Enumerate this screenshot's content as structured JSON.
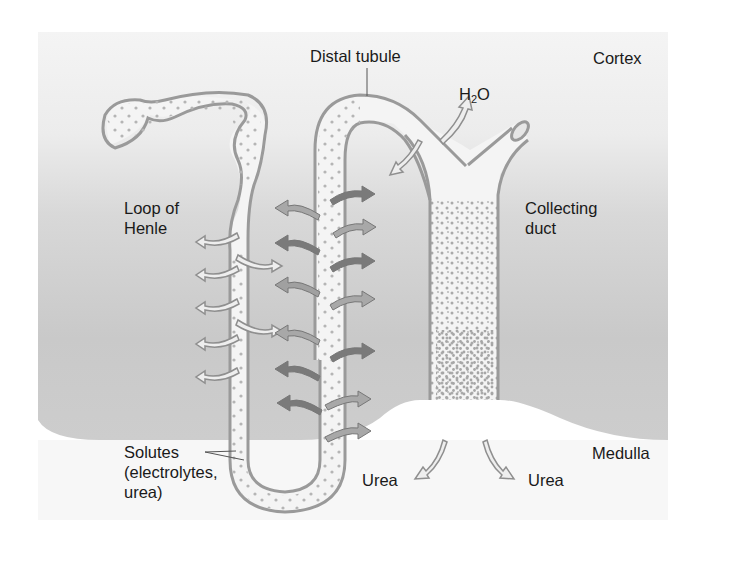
{
  "diagram": {
    "regions": {
      "top": "Cortex",
      "bottom": "Medulla"
    },
    "labels": {
      "distal_tubule": "Distal tubule",
      "cortex": "Cortex",
      "h2o_h": "H",
      "h2o_sub": "2",
      "h2o_o": "O",
      "loop_line1": "Loop of",
      "loop_line2": "Henle",
      "collecting_line1": "Collecting",
      "collecting_line2": "duct",
      "solutes_line1": "Solutes",
      "solutes_line2": "(electrolytes,",
      "solutes_line3": "urea)",
      "urea_left": "Urea",
      "urea_right": "Urea",
      "medulla": "Medulla"
    },
    "colors": {
      "cortex_bg": "#f2f2f2",
      "medulla_bg": "#c8c8c8",
      "tubule_fill": "#f4f4f4",
      "tubule_wall": "#9a9a9a",
      "arrow_dark": "#6e6e6e",
      "arrow_mid": "#8f8f8f",
      "arrow_light": "#e6e6e6",
      "text": "#1a1a1a"
    }
  }
}
